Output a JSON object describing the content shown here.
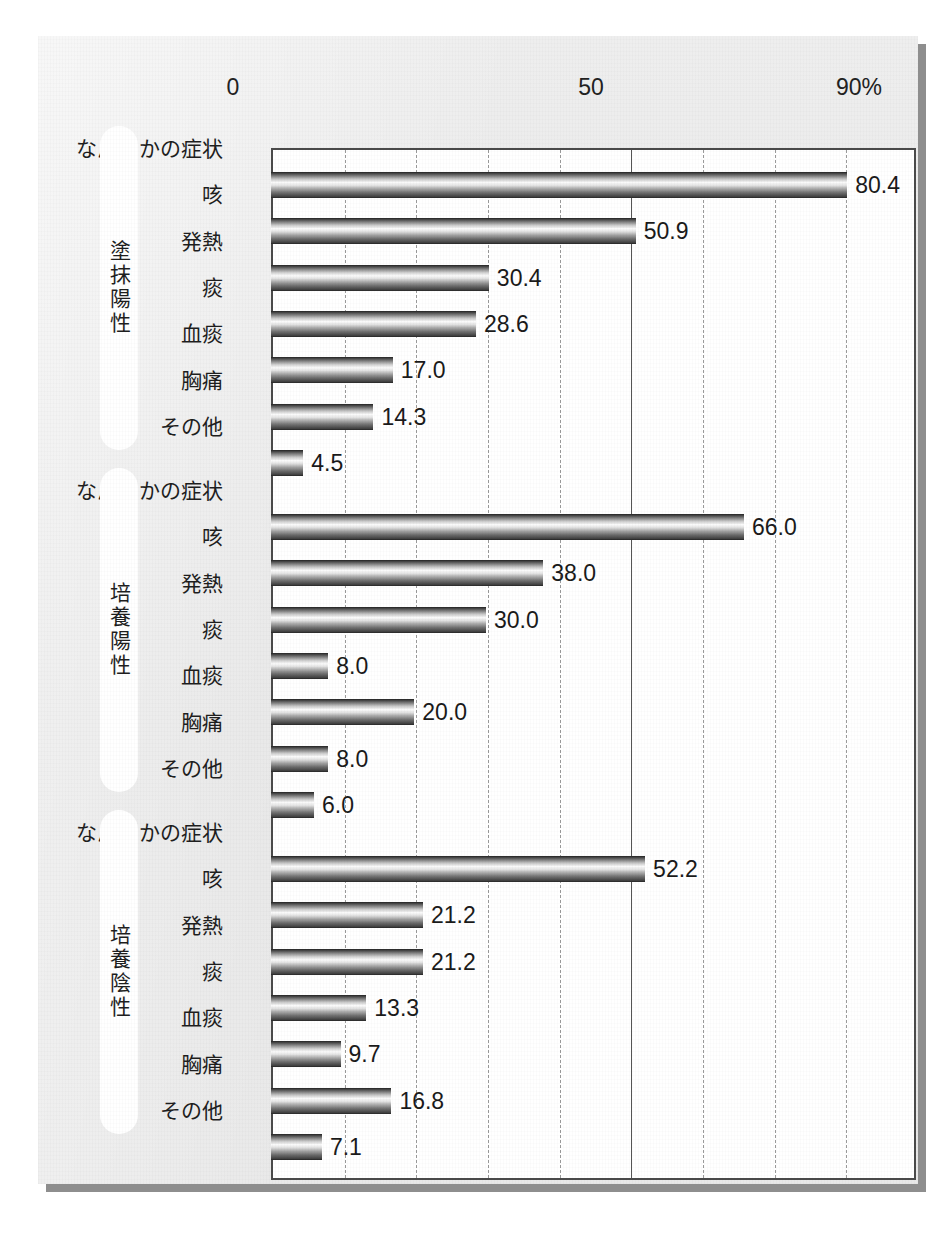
{
  "chart_data": {
    "type": "bar",
    "orientation": "horizontal",
    "title": "",
    "xlabel": "",
    "ylabel": "",
    "xlim": [
      0,
      90
    ],
    "grid": true,
    "grid_step": 10,
    "legend_position": "none",
    "axis_tick_labels": [
      "0",
      "50",
      "90%"
    ],
    "axis_tick_values": [
      0,
      50,
      90
    ],
    "categories": [
      "なんらかの症状",
      "咳",
      "発熱",
      "痰",
      "血痰",
      "胸痛",
      "その他"
    ],
    "series": [
      {
        "name": "塗抹陽性",
        "values": [
          80.4,
          50.9,
          30.4,
          28.6,
          17.0,
          14.3,
          4.5
        ],
        "value_labels": [
          "80.4",
          "50.9",
          "30.4",
          "28.6",
          "17.0",
          "14.3",
          "4.5"
        ]
      },
      {
        "name": "培養陽性",
        "values": [
          66.0,
          38.0,
          30.0,
          8.0,
          20.0,
          8.0,
          6.0
        ],
        "value_labels": [
          "66.0",
          "38.0",
          "30.0",
          "8.0",
          "20.0",
          "8.0",
          "6.0"
        ]
      },
      {
        "name": "培養陰性",
        "values": [
          52.2,
          21.2,
          21.2,
          13.3,
          9.7,
          16.8,
          7.1
        ],
        "value_labels": [
          "52.2",
          "21.2",
          "21.2",
          "13.3",
          "9.7",
          "16.8",
          "7.1"
        ]
      }
    ],
    "colors": {
      "panel_background": "#e9e9e9",
      "plot_background": "#ffffff",
      "plot_border": "#4a4a4a",
      "gridline": "#9a9a9a",
      "gridline_major": "#555555",
      "bar_dark": "#3a3a3a",
      "bar_light": "#fbfbfb",
      "text": "#1e1e1e",
      "pill_background": "#ffffff"
    }
  }
}
